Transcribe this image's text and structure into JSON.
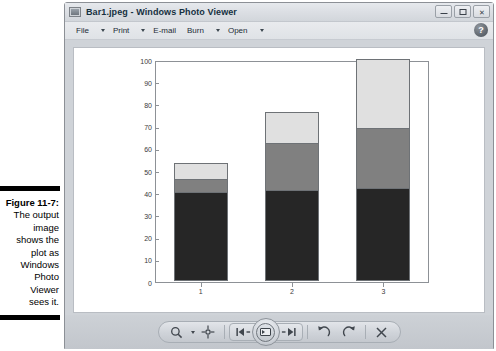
{
  "figure": {
    "label": "Figure 11-7:",
    "caption_lines": [
      "The output",
      "image",
      "shows the",
      "plot as",
      "Windows",
      "Photo",
      "Viewer",
      "sees it."
    ]
  },
  "window": {
    "title": "Bar1.jpeg - Windows Photo Viewer",
    "app_icon": "photo-viewer-icon",
    "controls": {
      "minimize": "minimize-icon",
      "maximize": "maximize-icon",
      "close": "✕"
    },
    "help_label": "?"
  },
  "menubar": {
    "items": [
      {
        "label": "File",
        "has_caret": true
      },
      {
        "label": "Print",
        "has_caret": true
      },
      {
        "label": "E-mail",
        "has_caret": false
      },
      {
        "label": "Burn",
        "has_caret": true
      },
      {
        "label": "Open",
        "has_caret": true
      }
    ]
  },
  "toolbar": {
    "zoom_label": "zoom-magnifier-icon",
    "fit_label": "fit-to-window-icon",
    "previous_label": "previous-image-icon",
    "play_label": "play-slideshow-icon",
    "next_label": "next-image-icon",
    "rotate_ccw_label": "rotate-counterclockwise-icon",
    "rotate_cw_label": "rotate-clockwise-icon",
    "delete_label": "✕"
  },
  "colors": {
    "segment_dark": "#262626",
    "segment_medium": "#808080",
    "segment_light": "#e0e0e0",
    "axis": "#8d9196",
    "canvas": "#ffffff",
    "window_chrome": "#d5d8dc"
  },
  "chart_data": {
    "type": "bar",
    "bar_mode": "stacked",
    "title": "",
    "xlabel": "",
    "ylabel": "",
    "categories": [
      "1",
      "2",
      "3"
    ],
    "xtick_labels": [
      "1",
      "2",
      "3"
    ],
    "ytick_labels": [
      "0",
      "10",
      "20",
      "30",
      "40",
      "50",
      "60",
      "70",
      "80",
      "90",
      "100"
    ],
    "ylim": [
      0,
      100
    ],
    "xlim": [
      0.5,
      3.5
    ],
    "grid": false,
    "legend": null,
    "series": [
      {
        "name": "Series 1",
        "color": "#262626",
        "values": [
          40,
          41,
          42
        ]
      },
      {
        "name": "Series 2",
        "color": "#808080",
        "values": [
          6,
          21,
          27
        ]
      },
      {
        "name": "Series 3",
        "color": "#e0e0e0",
        "values": [
          7,
          14,
          31
        ]
      }
    ],
    "stack_tops": [
      [
        40,
        46,
        53
      ],
      [
        41,
        62,
        76
      ],
      [
        42,
        69,
        100
      ]
    ]
  }
}
